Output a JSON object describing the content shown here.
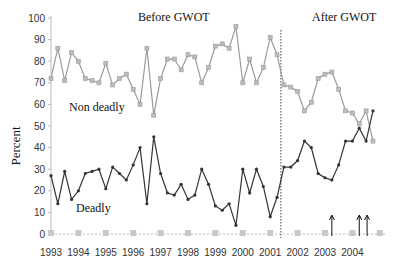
{
  "chart_data": {
    "type": "line",
    "title": "",
    "xlabel": "",
    "ylabel": "Percent",
    "ylim": [
      0,
      100
    ],
    "yticks": [
      0,
      10,
      20,
      30,
      40,
      50,
      60,
      70,
      80,
      90,
      100
    ],
    "xtick_labels": [
      "1993",
      "1994",
      "1995",
      "1996",
      "1997",
      "1998",
      "1999",
      "2000",
      "2001",
      "2002",
      "2003",
      "2004"
    ],
    "x_frequency": "quarterly",
    "grid": false,
    "legend": "none (inline series labels)",
    "annotations": [
      {
        "text": "Before  GWOT",
        "position": "top-center-left"
      },
      {
        "text": "After  GWOT",
        "position": "top-right"
      },
      {
        "text": "Non deadly",
        "position": "near non-deadly series"
      },
      {
        "text": "Deadly",
        "position": "near deadly series"
      },
      {
        "type": "vertical-dotted-line",
        "x": "2001 Q3/Q4 boundary",
        "label": "GWOT start"
      },
      {
        "type": "arrows",
        "x": [
          "2003 Q2",
          "2004 Q1",
          "2004 Q2"
        ]
      }
    ],
    "series": [
      {
        "name": "Non deadly",
        "color": "#9a9a9a",
        "marker": "square",
        "values": [
          72,
          86,
          71,
          84,
          80,
          72,
          71,
          70,
          79,
          69,
          72,
          74,
          67,
          60,
          86,
          55,
          72,
          81,
          81,
          76,
          83,
          82,
          70,
          77,
          87,
          88,
          86,
          96,
          70,
          81,
          70,
          77,
          91,
          83,
          69,
          68,
          66,
          57,
          61,
          72,
          74,
          75,
          67,
          57,
          56,
          51,
          57,
          43
        ]
      },
      {
        "name": "Deadly",
        "color": "#333333",
        "marker": "diamond",
        "values": [
          27,
          14,
          29,
          16,
          20,
          28,
          29,
          30,
          21,
          31,
          28,
          25,
          32,
          40,
          14,
          45,
          28,
          19,
          18,
          23,
          16,
          18,
          30,
          23,
          13,
          11,
          14,
          4,
          30,
          19,
          30,
          22,
          8,
          17,
          31,
          31,
          34,
          43,
          40,
          28,
          26,
          25,
          32,
          43,
          43,
          49,
          43,
          57
        ]
      },
      {
        "name": "Zero markers",
        "color": "#c8c8c8",
        "marker": "square",
        "note": "grey square markers along 0 at yearly intervals",
        "x": [
          "1993",
          "1994",
          "1995",
          "1996",
          "1997",
          "1998",
          "1999",
          "2000",
          "2001",
          "2002",
          "2003",
          "2004",
          "2005"
        ],
        "values": [
          0,
          0,
          0,
          0,
          0,
          0,
          0,
          0,
          0,
          0,
          0,
          0,
          0
        ]
      }
    ]
  },
  "labels": {
    "before": "Before  GWOT",
    "after": "After  GWOT",
    "nondeadly": "Non deadly",
    "deadly": "Deadly",
    "ylabel": "Percent"
  }
}
